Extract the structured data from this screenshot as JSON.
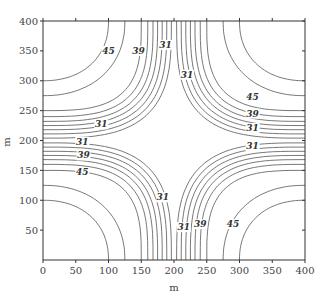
{
  "chart_data": {
    "type": "contour",
    "title": "",
    "xlabel": "m",
    "ylabel": "m",
    "xlim": [
      0,
      400
    ],
    "ylim": [
      0,
      400
    ],
    "xticks": [
      0,
      50,
      100,
      150,
      200,
      250,
      300,
      350,
      400
    ],
    "yticks": [
      50,
      100,
      150,
      200,
      250,
      300,
      350,
      400
    ],
    "grid": false,
    "contour_levels": [
      31,
      33,
      35,
      37,
      39,
      41,
      43,
      45,
      47
    ],
    "labeled_levels": [
      31,
      39,
      45
    ],
    "contour_labels": [
      {
        "text": "45",
        "x": 100,
        "y": 345,
        "quadrant": "top-left"
      },
      {
        "text": "39",
        "x": 146,
        "y": 345,
        "quadrant": "top-left"
      },
      {
        "text": "31",
        "x": 89,
        "y": 222,
        "quadrant": "top-left"
      },
      {
        "text": "31",
        "x": 187,
        "y": 355,
        "quadrant": "top-center"
      },
      {
        "text": "31",
        "x": 220,
        "y": 305,
        "quadrant": "top-right"
      },
      {
        "text": "45",
        "x": 320,
        "y": 268,
        "quadrant": "top-right"
      },
      {
        "text": "39",
        "x": 320,
        "y": 240,
        "quadrant": "top-right"
      },
      {
        "text": "31",
        "x": 320,
        "y": 216,
        "quadrant": "top-right"
      },
      {
        "text": "31",
        "x": 60,
        "y": 193,
        "quadrant": "bottom-left"
      },
      {
        "text": "39",
        "x": 62,
        "y": 170,
        "quadrant": "bottom-left"
      },
      {
        "text": "45",
        "x": 60,
        "y": 142,
        "quadrant": "bottom-left"
      },
      {
        "text": "31",
        "x": 183,
        "y": 100,
        "quadrant": "bottom-center"
      },
      {
        "text": "31",
        "x": 320,
        "y": 185,
        "quadrant": "bottom-right"
      },
      {
        "text": "31",
        "x": 215,
        "y": 50,
        "quadrant": "bottom-right"
      },
      {
        "text": "39",
        "x": 240,
        "y": 55,
        "quadrant": "bottom-right"
      },
      {
        "text": "45",
        "x": 290,
        "y": 55,
        "quadrant": "bottom-right"
      }
    ]
  }
}
